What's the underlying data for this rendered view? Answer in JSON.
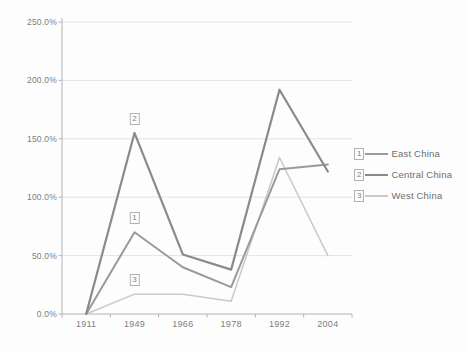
{
  "chart_data": {
    "type": "line",
    "title": "",
    "xlabel": "",
    "ylabel": "",
    "categories": [
      "1911",
      "1949",
      "1966",
      "1978",
      "1992",
      "2004"
    ],
    "series": [
      {
        "name": "East China",
        "marker_label": "1",
        "color": "#9a9a9a",
        "width": 2,
        "values": [
          0,
          70,
          40,
          23,
          124,
          128
        ]
      },
      {
        "name": "Central China",
        "marker_label": "2",
        "color": "#8a8a8a",
        "width": 2.2,
        "values": [
          0,
          155,
          51,
          38,
          192,
          122
        ]
      },
      {
        "name": "West China",
        "marker_label": "3",
        "color": "#c9c9c9",
        "width": 1.5,
        "values": [
          0,
          17,
          17,
          11,
          134,
          50
        ]
      }
    ],
    "ylim": [
      0,
      250
    ],
    "ytick_step": 50,
    "ytick_labels": [
      "0.0%",
      "50.0%",
      "100.0%",
      "150.0%",
      "200.0%",
      "250.0%"
    ],
    "grid": true,
    "legend_position": "right",
    "draw_order": [
      2,
      0,
      1
    ],
    "axis_color": "#b3b3b3",
    "grid_color": "#e4e4e4"
  }
}
